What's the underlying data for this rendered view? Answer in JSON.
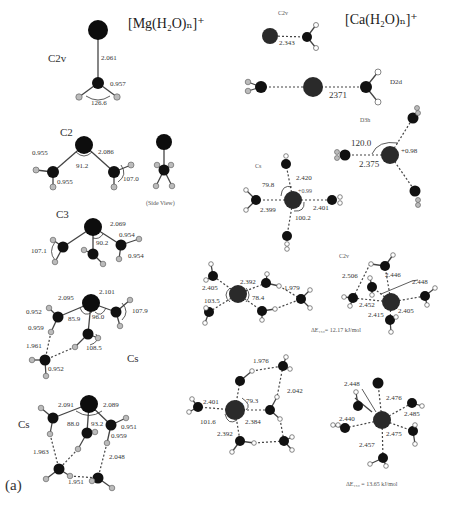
{
  "panel_label": "(a)",
  "mg_column": {
    "title": "[Mg(H₂O)ₙ]⁺",
    "structures": [
      {
        "n": 1,
        "symmetry": "C2v",
        "labels": {
          "mg_o": "2.061",
          "o_h": "0.957",
          "hoh": "126.6"
        }
      },
      {
        "n": 2,
        "symmetry": "C2",
        "labels": {
          "o_h_1": "0.955",
          "o_h_2": "0.955",
          "mg_o": "2.086",
          "omgo": "91.2",
          "angle": "107.0",
          "side_view": "(Side View)"
        }
      },
      {
        "n": 3,
        "symmetry": "C3",
        "labels": {
          "mg_o": "2.069",
          "omgo": "90.2",
          "angle": "107.1",
          "o_h_1": "0.954",
          "o_h_2": "0.954"
        }
      },
      {
        "n": 4,
        "symmetry": "Cs",
        "labels": {
          "mg_o_1": "2.095",
          "mg_o_2": "2.101",
          "o_h_1": "0.952",
          "o_h_2": "0.959",
          "hbond": "1.961",
          "a1": "85.9",
          "a2": "96.0",
          "a3": "107.9",
          "a4": "108.5",
          "o_h_3": "0.952"
        }
      },
      {
        "n": 5,
        "symmetry": "Cs",
        "labels": {
          "mg_o_1": "2.091",
          "mg_o_2": "2.089",
          "a1": "88.0",
          "a2": "93.2",
          "o_h_1": "0.951",
          "o_h_2": "0.959",
          "hbond_1": "1.963",
          "hbond_2": "2.048",
          "hbond_3": "1.951"
        }
      }
    ]
  },
  "ca_column": {
    "title": "[Ca(H₂O)ₙ]⁺",
    "structures": [
      {
        "n": 1,
        "symmetry": "C2v",
        "labels": {
          "ca_o": "2.343"
        }
      },
      {
        "n": 2,
        "symmetry": "D2d",
        "labels": {
          "ca_o": "2371"
        }
      },
      {
        "n": 3,
        "symmetry": "D3h",
        "labels": {
          "angle": "120.0",
          "charge": "+0.98",
          "ca_o": "2.375"
        }
      },
      {
        "n": 4,
        "symmetry": "Cs",
        "labels": {
          "ca_o_1": "2.420",
          "ca_o_2": "2.399",
          "ca_o_3": "2.401",
          "a1": "79.8",
          "a2": "100.2",
          "charge": "+0.99"
        }
      },
      {
        "n": 4,
        "symmetry": "Cs",
        "labels": {
          "ca_o_1": "2.405",
          "ca_o_2": "2.392",
          "hbond": "1.979",
          "a1": "103.5",
          "a2": "78.4"
        }
      },
      {
        "n": 5,
        "symmetry": "C2v",
        "labels": {
          "hb": "2.506",
          "l1": "2.446",
          "l2": "2.448",
          "l3": "2.452",
          "l4": "2.415",
          "l5": "2.405"
        },
        "energy": "ΔE₁₅₀= 12.17 kJ/mol"
      },
      {
        "n": 5,
        "symmetry": "Cs",
        "labels": {
          "hbond_1": "1.976",
          "hbond_2": "2.042",
          "ca_o_1": "2.401",
          "a1": "79.3",
          "a2": "101.6",
          "ca_o_2": "2.384",
          "ca_o_3": "2.392"
        }
      },
      {
        "n": 6,
        "symmetry": "",
        "labels": {
          "l1": "2.448",
          "l2": "2.476",
          "l3": "2.440",
          "l4": "2.485",
          "l5": "2.475",
          "l6": "2.457"
        },
        "energy": "ΔE₁₅₀ = 13.65 kJ/mol"
      }
    ]
  }
}
